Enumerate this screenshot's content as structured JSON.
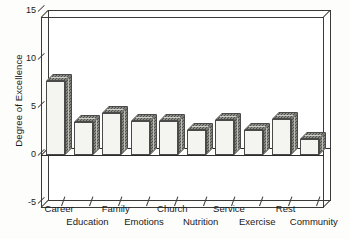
{
  "chart_data": {
    "type": "bar",
    "title": "",
    "xlabel": "",
    "ylabel": "Degree of Excellence",
    "ylim": [
      -5,
      15
    ],
    "yticks": [
      15,
      10,
      5,
      0,
      -5
    ],
    "grid": false,
    "legend": null,
    "style": "3d-shaded-bars",
    "categories": [
      "Career",
      "Education",
      "Family",
      "Emotions",
      "Church",
      "Nutrition",
      "Service",
      "Exercise",
      "Rest",
      "Community"
    ],
    "values": [
      7.7,
      3.4,
      4.4,
      3.5,
      3.5,
      2.6,
      3.6,
      2.6,
      3.7,
      1.7
    ],
    "colors": {
      "bar_face": "#f4f4f0",
      "bar_side": "#bdbdb6",
      "bar_top": "#cfcfc9",
      "axis": "#3a3a38",
      "text": "#1a1a1a",
      "background": "#ffffff"
    }
  },
  "axis": {
    "y_title": "Degree of Excellence",
    "y_tick_labels": [
      "15",
      "10",
      "5",
      "0",
      "-5"
    ],
    "x_tick_labels_row_top": [
      "Career",
      "Family",
      "Church",
      "Service",
      "Rest"
    ],
    "x_tick_labels_row_bottom": [
      "Education",
      "Emotions",
      "Nutrition",
      "Exercise",
      "Community"
    ]
  }
}
